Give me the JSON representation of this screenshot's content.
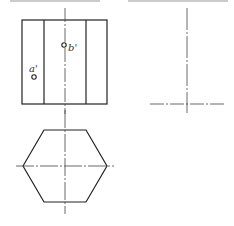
{
  "diagram": {
    "type": "orthographic-projection",
    "views": [
      "front-view",
      "side-view",
      "top-view"
    ],
    "colors": {
      "line": "#222222",
      "centerline": "#444444",
      "background": "#ffffff"
    }
  },
  "front_view": {
    "rect": {
      "x": 22,
      "y": 20,
      "w": 85,
      "h": 84
    },
    "inner_edges_x": [
      44,
      86
    ],
    "centerline_x": 65,
    "points": [
      {
        "label": "a'",
        "cx": 34,
        "cy": 77
      },
      {
        "label": "b'",
        "cx": 64,
        "cy": 45
      }
    ]
  },
  "side_view": {
    "centerline_x": 187,
    "baseline_y": 104
  },
  "top_view": {
    "shape": "hexagon",
    "center": {
      "x": 65,
      "y": 166
    }
  },
  "labels": {
    "a": "a'",
    "b": "b'"
  }
}
